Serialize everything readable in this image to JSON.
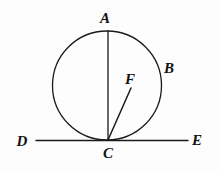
{
  "figure": {
    "background_color": "#fdfdfd",
    "stroke_color": "#1a1a1a",
    "label_color": "#121212"
  },
  "circle": {
    "center_x": 107,
    "center_y": 85.5,
    "radius": 54.5,
    "stroke_width": 1.3
  },
  "lines": {
    "diameter_ac": {
      "x1": 108,
      "y1": 31,
      "x2": 108,
      "y2": 140,
      "stroke_width": 1.3
    },
    "ray_cf": {
      "x1": 108,
      "y1": 140,
      "x2": 131,
      "y2": 88,
      "stroke_width": 1.5
    },
    "tangent_de": {
      "x1": 36,
      "y1": 140.5,
      "x2": 188,
      "y2": 140.5,
      "stroke_width": 1.3
    }
  },
  "labels": [
    {
      "id": "A",
      "text": "A",
      "x": 105,
      "y": 18,
      "size": 15
    },
    {
      "id": "B",
      "text": "B",
      "x": 169,
      "y": 68,
      "size": 15
    },
    {
      "id": "F",
      "text": "F",
      "x": 130,
      "y": 79,
      "size": 15
    },
    {
      "id": "C",
      "text": "C",
      "x": 108,
      "y": 153,
      "size": 15
    },
    {
      "id": "D",
      "text": "D",
      "x": 22,
      "y": 141,
      "size": 15
    },
    {
      "id": "E",
      "text": "E",
      "x": 197,
      "y": 140,
      "size": 15
    }
  ]
}
